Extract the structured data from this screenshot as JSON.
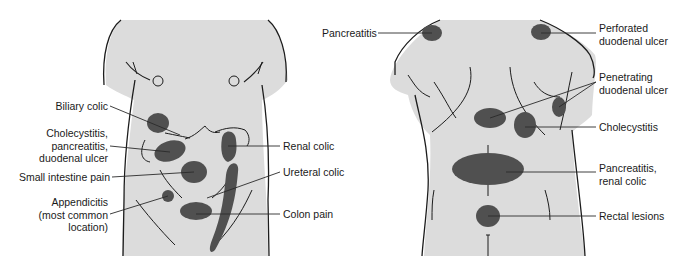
{
  "colors": {
    "body_fill": "#dcdcdc",
    "spot_fill": "#505050",
    "outline": "#1c1c1c",
    "leader": "#2a2a2a"
  },
  "front_view": {
    "labels": [
      {
        "id": "biliary-colic",
        "text": "Biliary colic"
      },
      {
        "id": "cholecystitis-group",
        "text": "Cholecystitis,\npancreatitis,\nduodenal ulcer"
      },
      {
        "id": "small-intestine-pain",
        "text": "Small intestine pain"
      },
      {
        "id": "appendicitis",
        "text": "Appendicitis\n(most common\nlocation)"
      },
      {
        "id": "renal-colic",
        "text": "Renal colic"
      },
      {
        "id": "ureteral-colic",
        "text": "Ureteral colic"
      },
      {
        "id": "colon-pain",
        "text": "Colon pain"
      }
    ]
  },
  "back_view": {
    "labels": [
      {
        "id": "pancreatitis",
        "text": "Pancreatitis"
      },
      {
        "id": "perforated-duodenal-ulcer",
        "text": "Perforated\nduodenal ulcer"
      },
      {
        "id": "penetrating-duodenal-ulcer",
        "text": "Penetrating\nduodenal ulcer"
      },
      {
        "id": "cholecystitis",
        "text": "Cholecystitis"
      },
      {
        "id": "pancreatitis-renal-colic",
        "text": "Pancreatitis,\nrenal colic"
      },
      {
        "id": "rectal-lesions",
        "text": "Rectal lesions"
      }
    ]
  }
}
